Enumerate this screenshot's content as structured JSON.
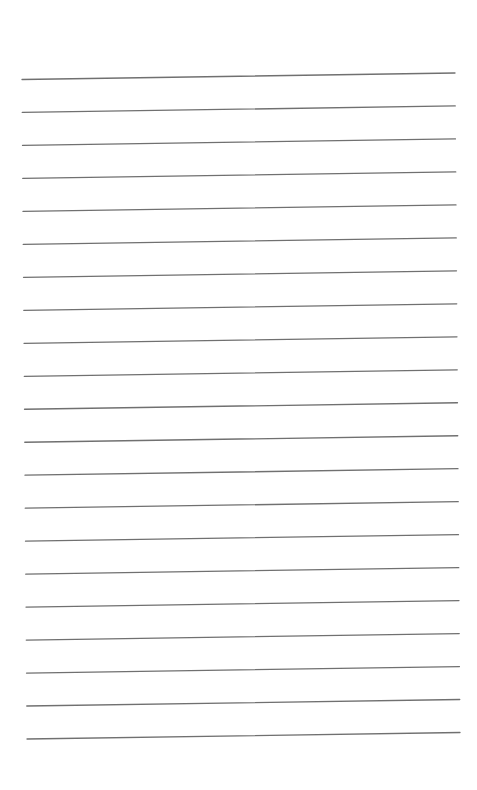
{
  "page": {
    "type": "lined-paper",
    "line_count": 21,
    "line_color": "#707070",
    "background_color": "#ffffff",
    "text_content": []
  }
}
